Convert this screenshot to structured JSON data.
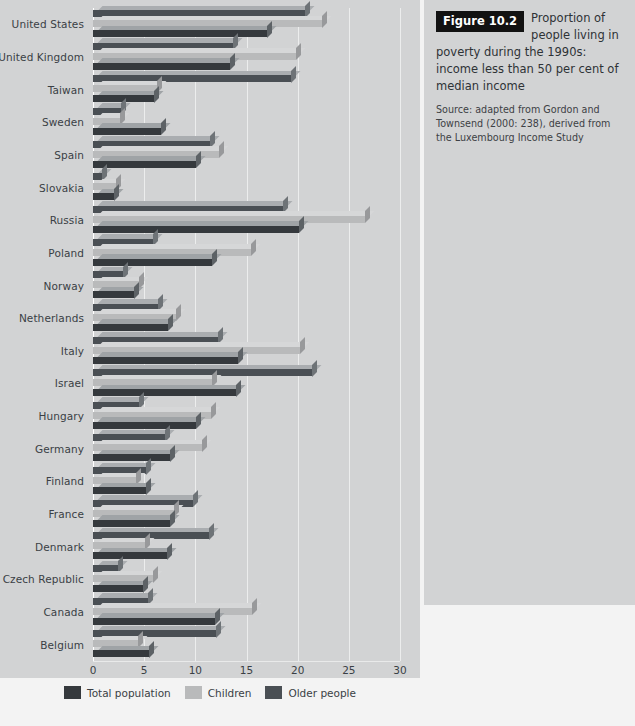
{
  "figure": {
    "tag": "Figure 10.2",
    "title": "Proportion of people living in poverty during the 1990s: income less than 50 per cent of median income",
    "source": "Source: adapted from Gordon and Townsend (2000: 238), derived from the Luxembourg Income Study"
  },
  "legend": {
    "items": [
      {
        "label": "Total population",
        "color": "#35393d",
        "icon": "square-swatch-icon"
      },
      {
        "label": "Children",
        "color": "#b9babb",
        "icon": "square-swatch-icon"
      },
      {
        "label": "Older people",
        "color": "#4a4f54",
        "icon": "square-swatch-icon"
      }
    ]
  },
  "chart_data": {
    "type": "bar",
    "orientation": "horizontal",
    "title": "Proportion of people living in poverty during the 1990s: income less than 50 per cent of median income",
    "xlabel": "",
    "ylabel": "",
    "xlim": [
      0,
      30
    ],
    "xticks": [
      0,
      5,
      10,
      15,
      20,
      25,
      30
    ],
    "grid": true,
    "legend_position": "bottom",
    "categories": [
      "United States",
      "United Kingdom",
      "Taiwan",
      "Sweden",
      "Spain",
      "Slovakia",
      "Russia",
      "Poland",
      "Norway",
      "Netherlands",
      "Italy",
      "Israel",
      "Hungary",
      "Germany",
      "Finland",
      "France",
      "Denmark",
      "Czech Republic",
      "Canada",
      "Belgium"
    ],
    "series": [
      {
        "name": "Total population",
        "color": "#35393d",
        "values": [
          17.0,
          13.4,
          6.0,
          6.6,
          10.1,
          2.1,
          20.1,
          11.6,
          4.0,
          7.3,
          14.2,
          14.0,
          10.1,
          7.5,
          5.2,
          7.5,
          7.2,
          4.9,
          11.9,
          5.5
        ]
      },
      {
        "name": "Children",
        "color": "#b9babb",
        "values": [
          22.4,
          19.8,
          6.3,
          2.6,
          12.3,
          2.2,
          26.6,
          15.4,
          4.5,
          8.1,
          20.2,
          11.6,
          11.5,
          10.7,
          4.2,
          7.9,
          5.1,
          5.9,
          15.5,
          4.4
        ]
      },
      {
        "name": "Older people",
        "color": "#4a4f54",
        "values": [
          20.7,
          13.7,
          19.3,
          2.7,
          11.4,
          0.9,
          18.6,
          5.9,
          2.9,
          6.4,
          12.2,
          21.4,
          4.5,
          7.0,
          5.2,
          9.8,
          11.3,
          2.4,
          5.4,
          12.0
        ]
      }
    ]
  }
}
